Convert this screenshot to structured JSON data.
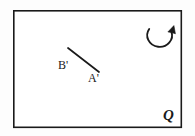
{
  "figure": {
    "background_color": "#fdfdfd",
    "stroke_color": "#1a1a1a",
    "frame": {
      "name": "plane-boundary-rectangle",
      "x": 13,
      "y": 10,
      "width": 169,
      "height": 118,
      "stroke_width": 1.6,
      "fill_color": "#ffffff",
      "stroke_color": "#1a1a1a"
    },
    "segment": {
      "name": "segment-a-prime-b-prime",
      "x1": 68,
      "y1": 48,
      "x2": 99,
      "y2": 72,
      "stroke_width": 1.7,
      "stroke_color": "#1a1a1a"
    },
    "rotation_arrow": {
      "name": "counterclockwise-rotation-arrow",
      "center_x": 161,
      "center_y": 33,
      "radius_x": 12,
      "radius_y": 11,
      "stroke_width": 1.8,
      "stroke_color": "#1a1a1a",
      "direction": "counterclockwise",
      "arrowhead_x": 172.6,
      "arrowhead_y": 27.5
    },
    "labels": {
      "b_prime": "B'",
      "a_prime": "A'",
      "region_q": "Q"
    }
  }
}
